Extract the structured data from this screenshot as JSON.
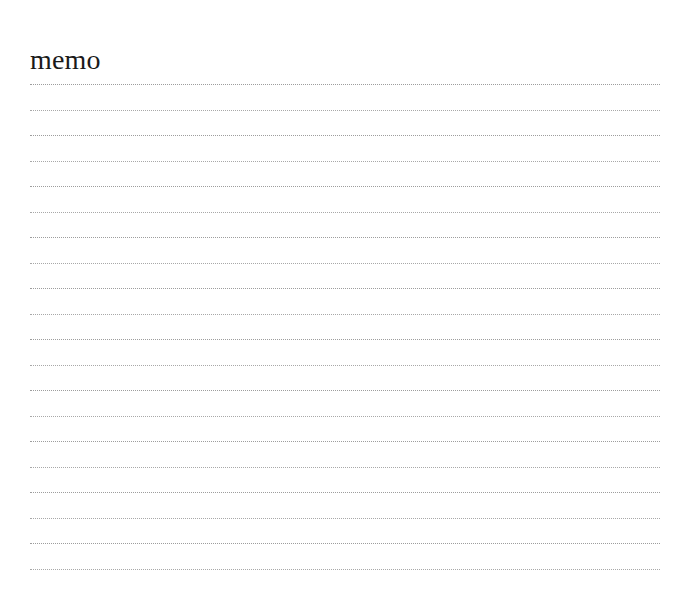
{
  "document": {
    "title": "memo",
    "background_color": "#ffffff",
    "title_color": "#1a1a1a",
    "rule_color": "#a3a3a3",
    "rule_style": "dotted",
    "rule_count": 20,
    "page_width_px": 686,
    "page_height_px": 589
  },
  "lines": [
    {
      "index": 1,
      "text": ""
    },
    {
      "index": 2,
      "text": ""
    },
    {
      "index": 3,
      "text": ""
    },
    {
      "index": 4,
      "text": ""
    },
    {
      "index": 5,
      "text": ""
    },
    {
      "index": 6,
      "text": ""
    },
    {
      "index": 7,
      "text": ""
    },
    {
      "index": 8,
      "text": ""
    },
    {
      "index": 9,
      "text": ""
    },
    {
      "index": 10,
      "text": ""
    },
    {
      "index": 11,
      "text": ""
    },
    {
      "index": 12,
      "text": ""
    },
    {
      "index": 13,
      "text": ""
    },
    {
      "index": 14,
      "text": ""
    },
    {
      "index": 15,
      "text": ""
    },
    {
      "index": 16,
      "text": ""
    },
    {
      "index": 17,
      "text": ""
    },
    {
      "index": 18,
      "text": ""
    },
    {
      "index": 19,
      "text": ""
    },
    {
      "index": 20,
      "text": ""
    }
  ]
}
